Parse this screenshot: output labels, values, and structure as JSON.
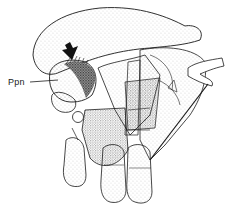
{
  "figure": {
    "type": "scientific stippled illustration",
    "labels": [
      {
        "id": "ppn",
        "text": "Ppn",
        "x": 8,
        "y": 77
      }
    ],
    "arrow": {
      "direction": "down",
      "points_to": "dark hatched region"
    },
    "colors": {
      "ink": "#1a1a1a",
      "background": "#ffffff",
      "stipple": "#555555"
    }
  }
}
